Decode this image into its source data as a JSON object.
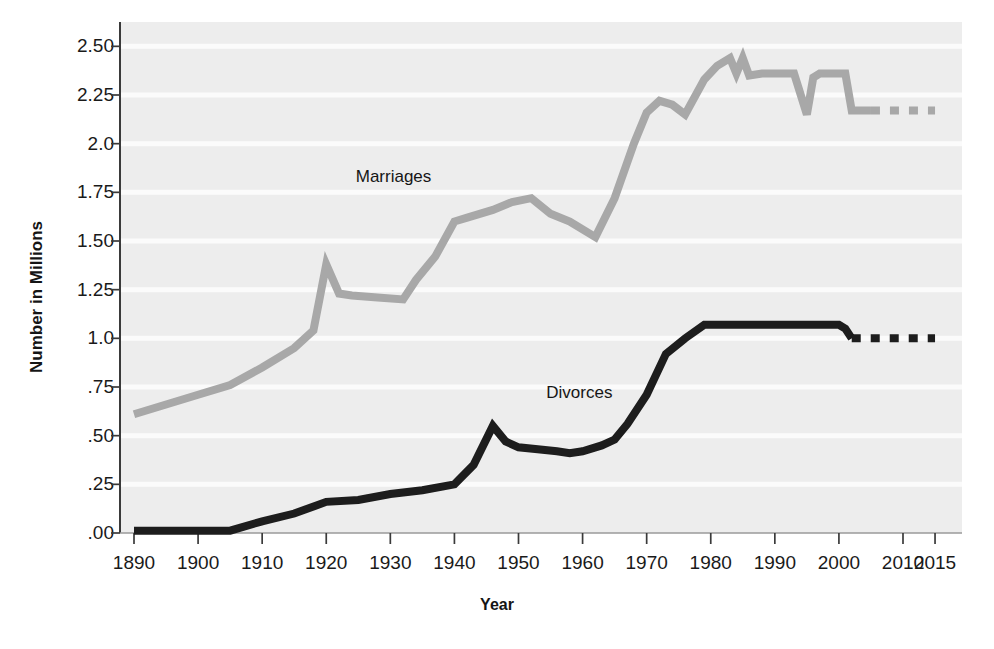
{
  "chart_data": {
    "type": "line",
    "title": "",
    "xlabel": "Year",
    "ylabel": "Number in Millions",
    "xlim": [
      1890,
      2015
    ],
    "ylim": [
      0.0,
      2.625
    ],
    "grid": "horizontal",
    "legend": "inline-annotations",
    "x_tick_labels": [
      "1890",
      "1900",
      "1910",
      "1920",
      "1930",
      "1940",
      "1950",
      "1960",
      "1970",
      "1980",
      "1990",
      "2000",
      "2010",
      "2015"
    ],
    "x_tick_values": [
      1890,
      1900,
      1910,
      1920,
      1930,
      1940,
      1950,
      1960,
      1970,
      1980,
      1990,
      2000,
      2010,
      2015
    ],
    "y_tick_labels": [
      ".00",
      ".25",
      ".50",
      ".75",
      "1.0",
      "1.25",
      "1.50",
      "1.75",
      "2.0",
      "2.25",
      "2.50"
    ],
    "y_tick_values": [
      0.0,
      0.25,
      0.5,
      0.75,
      1.0,
      1.25,
      1.5,
      1.75,
      2.0,
      2.25,
      2.5
    ],
    "series": [
      {
        "name": "Marriages",
        "color": "#a8a8a8",
        "label_x": 1930.5,
        "label_y": 1.83,
        "solid_x": [
          1890,
          1895,
          1900,
          1905,
          1910,
          1915,
          1918,
          1920,
          1922,
          1924,
          1928,
          1932,
          1934,
          1937,
          1940,
          1942,
          1946,
          1949,
          1952,
          1955,
          1958,
          1962,
          1965,
          1968,
          1970,
          1972,
          1974,
          1976,
          1979,
          1981,
          1983,
          1984,
          1985,
          1986,
          1988,
          1993,
          1995,
          1996,
          1997,
          1999,
          2000,
          2001,
          2002,
          2005
        ],
        "solid_y": [
          0.61,
          0.66,
          0.71,
          0.76,
          0.85,
          0.95,
          1.04,
          1.38,
          1.23,
          1.22,
          1.21,
          1.2,
          1.3,
          1.42,
          1.6,
          1.62,
          1.66,
          1.7,
          1.72,
          1.64,
          1.6,
          1.52,
          1.72,
          2.0,
          2.16,
          2.22,
          2.2,
          2.15,
          2.33,
          2.4,
          2.44,
          2.36,
          2.44,
          2.35,
          2.36,
          2.36,
          2.15,
          2.34,
          2.36,
          2.36,
          2.36,
          2.36,
          2.17,
          2.17
        ],
        "dashed_x": [
          2005,
          2015
        ],
        "dashed_y": [
          2.17,
          2.17
        ]
      },
      {
        "name": "Divorces",
        "color": "#1d1d1d",
        "label_x": 1959.5,
        "label_y": 0.72,
        "solid_x": [
          1890,
          1900,
          1905,
          1910,
          1915,
          1920,
          1925,
          1930,
          1935,
          1940,
          1943,
          1946,
          1948,
          1950,
          1953,
          1956,
          1958,
          1960,
          1963,
          1965,
          1967,
          1970,
          1973,
          1976,
          1979,
          1985,
          1990,
          1995,
          2000,
          2001,
          2002
        ],
        "solid_y": [
          0.012,
          0.012,
          0.012,
          0.06,
          0.1,
          0.16,
          0.17,
          0.2,
          0.22,
          0.25,
          0.35,
          0.55,
          0.47,
          0.44,
          0.43,
          0.42,
          0.41,
          0.42,
          0.45,
          0.48,
          0.56,
          0.71,
          0.92,
          1.0,
          1.07,
          1.07,
          1.07,
          1.07,
          1.07,
          1.05,
          1.0
        ],
        "dashed_x": [
          2002,
          2015
        ],
        "dashed_y": [
          1.0,
          1.0
        ]
      }
    ],
    "annotations": [
      {
        "text": "Marriages",
        "x": 1930.5,
        "y": 1.83
      },
      {
        "text": "Divorces",
        "x": 1959.5,
        "y": 0.72
      }
    ],
    "colors": {
      "plot_background": "#ededed",
      "gridline": "#fbfbfb",
      "axis": "#3a3a3a",
      "marriages": "#a8a8a8",
      "divorces": "#1d1d1d",
      "text": "#1a1a1a"
    }
  }
}
